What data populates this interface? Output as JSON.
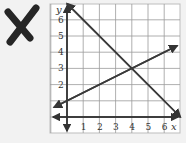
{
  "mark": {
    "icon": "x-mark-icon",
    "color": "#262626"
  },
  "chart_data": {
    "type": "line",
    "title": "",
    "xlabel": "x",
    "ylabel": "y",
    "xlim": [
      -0.8,
      7.2
    ],
    "ylim": [
      -0.8,
      7.2
    ],
    "x_ticks": [
      "1",
      "2",
      "3",
      "4",
      "5",
      "6"
    ],
    "y_ticks": [
      "2",
      "3",
      "4",
      "5",
      "6"
    ],
    "grid": true,
    "series": [
      {
        "name": "line-decreasing",
        "equation": "y = -x + 7",
        "points": [
          [
            0,
            7
          ],
          [
            7,
            0
          ]
        ],
        "color": "#3a3a3a"
      },
      {
        "name": "line-increasing",
        "equation": "y = 0.5x + 1",
        "points": [
          [
            -0.8,
            0.6
          ],
          [
            6.8,
            4.4
          ]
        ],
        "color": "#3a3a3a"
      }
    ],
    "intersection": [
      4,
      3
    ]
  },
  "colors": {
    "grid": "#9a9a9a",
    "axis": "#333333",
    "frame": "#bdbdbd",
    "background": "#ffffff",
    "page": "#f2f2f2"
  }
}
